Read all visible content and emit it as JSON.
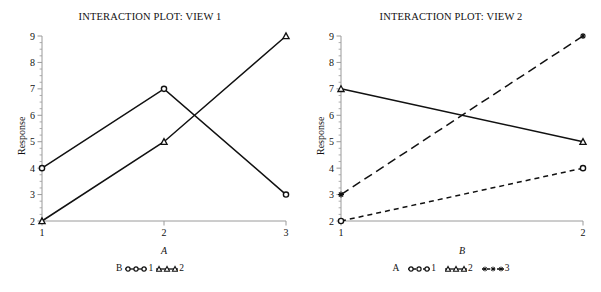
{
  "figure": {
    "background": "#ffffff",
    "axis_color": "#9a9a9a",
    "line_color": "#111111"
  },
  "panels": [
    {
      "id": "view-1",
      "title": "INTERACTION PLOT: VIEW 1",
      "ylabel": "Response",
      "xlabel": "A",
      "legend_title": "B",
      "legend": [
        {
          "label": "1",
          "marker": "circle",
          "dash": "solid"
        },
        {
          "label": "2",
          "marker": "triangle",
          "dash": "solid"
        }
      ]
    },
    {
      "id": "view-2",
      "title": "INTERACTION PLOT: VIEW 2",
      "ylabel": "Response",
      "xlabel": "B",
      "legend_title": "A",
      "legend": [
        {
          "label": "1",
          "marker": "circle",
          "dash": "short-dash"
        },
        {
          "label": "2",
          "marker": "triangle",
          "dash": "solid"
        },
        {
          "label": "3",
          "marker": "cross",
          "dash": "long-dash"
        }
      ]
    }
  ],
  "chart_data": [
    {
      "type": "line",
      "title": "INTERACTION PLOT: VIEW 1",
      "xlabel": "A",
      "ylabel": "Response",
      "categories": [
        "1",
        "2",
        "3"
      ],
      "x": [
        1,
        2,
        3
      ],
      "xlim": [
        1,
        3
      ],
      "ylim": [
        2,
        9
      ],
      "yticks": [
        2,
        3,
        4,
        5,
        6,
        7,
        8,
        9
      ],
      "xticks": [
        "1",
        "2",
        "3"
      ],
      "grid": false,
      "legend_title": "B",
      "legend_position": "below-axis",
      "series": [
        {
          "name": "1",
          "values": [
            4,
            7,
            3
          ],
          "marker": "circle",
          "dash": "solid"
        },
        {
          "name": "2",
          "values": [
            2,
            5,
            9
          ],
          "marker": "triangle",
          "dash": "solid"
        }
      ]
    },
    {
      "type": "line",
      "title": "INTERACTION PLOT: VIEW 2",
      "xlabel": "B",
      "ylabel": "Response",
      "categories": [
        "1",
        "2"
      ],
      "x": [
        1,
        2
      ],
      "xlim": [
        1,
        2
      ],
      "ylim": [
        2,
        9
      ],
      "yticks": [
        2,
        3,
        4,
        5,
        6,
        7,
        8,
        9
      ],
      "xticks": [
        "1",
        "2"
      ],
      "grid": false,
      "legend_title": "A",
      "legend_position": "below-axis",
      "series": [
        {
          "name": "1",
          "values": [
            2,
            4
          ],
          "marker": "circle",
          "dash": "short-dash"
        },
        {
          "name": "2",
          "values": [
            7,
            5
          ],
          "marker": "triangle",
          "dash": "solid"
        },
        {
          "name": "3",
          "values": [
            3,
            9
          ],
          "marker": "cross",
          "dash": "long-dash"
        }
      ]
    }
  ]
}
